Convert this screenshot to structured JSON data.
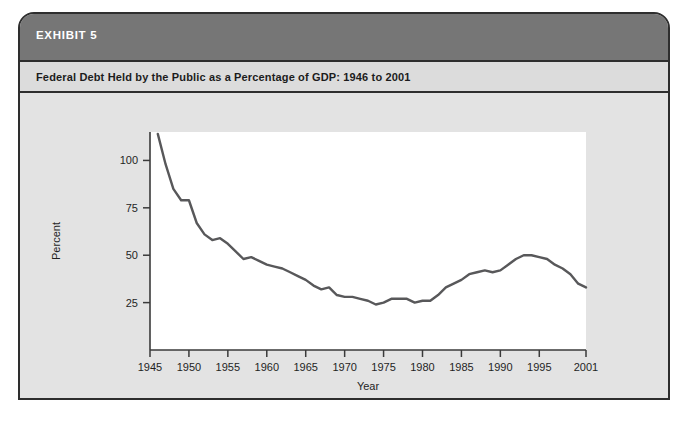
{
  "exhibit": {
    "label": "EXHIBIT 5",
    "title": "Federal Debt Held by the Public as a Percentage of GDP: 1946 to 2001"
  },
  "colors": {
    "header_bar": "#767676",
    "subtitle_bar": "#dcdcdc",
    "card_background": "#e3e3e3",
    "card_border": "#2e2e2e",
    "plot_background": "#ffffff",
    "line": "#58585a",
    "axis": "#3a3a3a",
    "text": "#1f1f1f"
  },
  "chart_data": {
    "type": "line",
    "title": "Federal Debt Held by the Public as a Percentage of GDP: 1946 to 2001",
    "xlabel": "Year",
    "ylabel": "Percent",
    "xlim": [
      1945,
      2001
    ],
    "ylim": [
      0,
      115
    ],
    "grid": false,
    "legend": null,
    "xticks": [
      1945,
      1950,
      1955,
      1960,
      1965,
      1970,
      1975,
      1980,
      1985,
      1990,
      1995,
      2001
    ],
    "xtick_labels": [
      "1945",
      "1950",
      "1955",
      "1960",
      "1965",
      "1970",
      "1975",
      "1980",
      "1985",
      "1990",
      "1995",
      "2001"
    ],
    "yticks": [
      25,
      50,
      75,
      100
    ],
    "ytick_labels": [
      "25",
      "50",
      "75",
      "100"
    ],
    "series": [
      {
        "name": "Federal Debt Held by the Public (% of GDP)",
        "x": [
          1946,
          1947,
          1948,
          1949,
          1950,
          1951,
          1952,
          1953,
          1954,
          1955,
          1956,
          1957,
          1958,
          1959,
          1960,
          1961,
          1962,
          1963,
          1964,
          1965,
          1966,
          1967,
          1968,
          1969,
          1970,
          1971,
          1972,
          1973,
          1974,
          1975,
          1976,
          1977,
          1978,
          1979,
          1980,
          1981,
          1982,
          1983,
          1984,
          1985,
          1986,
          1987,
          1988,
          1989,
          1990,
          1991,
          1992,
          1993,
          1994,
          1995,
          1996,
          1997,
          1998,
          1999,
          2000,
          2001
        ],
        "y": [
          114,
          98,
          85,
          79,
          79,
          67,
          61,
          58,
          59,
          56,
          52,
          48,
          49,
          47,
          45,
          44,
          43,
          41,
          39,
          37,
          34,
          32,
          33,
          29,
          28,
          28,
          27,
          26,
          24,
          25,
          27,
          27,
          27,
          25,
          26,
          26,
          29,
          33,
          35,
          37,
          40,
          41,
          42,
          41,
          42,
          45,
          48,
          50,
          50,
          49,
          48,
          45,
          43,
          40,
          35,
          33
        ]
      }
    ]
  }
}
